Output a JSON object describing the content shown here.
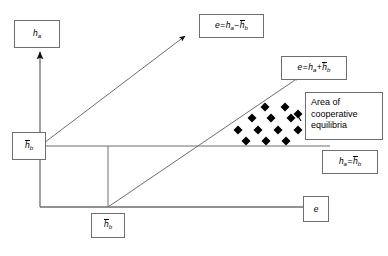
{
  "figure": {
    "background_color": "#ffffff",
    "line_color": "#6e6e6e",
    "axis_color": "#6e6e6e",
    "marker_color": "#000000",
    "box_border_color": "#6e6e6e",
    "width": 388,
    "height": 256
  },
  "axes": {
    "y_axis_label": "ha",
    "x_axis_label": "e",
    "origin": {
      "x": 40,
      "y": 207
    },
    "x_axis_end": {
      "x": 318,
      "y": 207
    },
    "y_axis_end": {
      "x": 40,
      "y": 52
    }
  },
  "labels": {
    "y_axis_box": {
      "text": "ha",
      "var": "h",
      "sub": "a",
      "overbar": false
    },
    "x_axis_box": {
      "text": "e",
      "var": "e",
      "sub": "",
      "overbar": false
    },
    "y_tick_box": {
      "text": "hb",
      "var": "h",
      "sub": "b",
      "overbar": true
    },
    "x_tick_box": {
      "text": "hb",
      "var": "h",
      "sub": "b",
      "overbar": true
    },
    "upper_line_box": {
      "text": "e = ha - hb",
      "lhs": "e",
      "operator": "−",
      "rhs_first": "h",
      "rhs_first_sub": "a",
      "rhs_second": "h",
      "rhs_second_sub": "b",
      "rhs_second_overbar": true
    },
    "lower_line_box": {
      "text": "e = ha + hb",
      "lhs": "e",
      "operator": "+",
      "rhs_first": "h",
      "rhs_first_sub": "a",
      "rhs_second": "h",
      "rhs_second_sub": "b",
      "rhs_second_overbar": true
    },
    "horizontal_line_box": {
      "text": "ha = hb",
      "lhs": "h",
      "lhs_sub": "a",
      "operator": "=",
      "rhs": "h",
      "rhs_sub": "b",
      "rhs_overbar": true
    },
    "area_box": {
      "line1": "Area of",
      "line2": "cooperative",
      "line3": "equilibria"
    }
  },
  "chart_data": {
    "type": "scatter",
    "title": "Area of cooperative equilibria",
    "xlabel": "e",
    "ylabel": "ha",
    "grid": false,
    "legend": "none",
    "lines": [
      {
        "name": "e = ha - hb",
        "from": {
          "x": 40,
          "y": 146
        },
        "to": {
          "x": 188,
          "y": 33
        },
        "arrow": true
      },
      {
        "name": "e = ha + hb",
        "from": {
          "x": 108,
          "y": 207
        },
        "to": {
          "x": 298,
          "y": 78
        },
        "arrow": false
      },
      {
        "name": "ha = hb",
        "from": {
          "x": 40,
          "y": 146
        },
        "to": {
          "x": 330,
          "y": 146
        },
        "arrow": false
      },
      {
        "name": "hb-tick-vertical",
        "from": {
          "x": 108,
          "y": 146
        },
        "to": {
          "x": 108,
          "y": 207
        },
        "arrow": false
      }
    ],
    "markers": {
      "shape": "diamond",
      "color": "#000000",
      "size": 7,
      "count": 13,
      "points": [
        {
          "x": 238,
          "y": 130
        },
        {
          "x": 258,
          "y": 130
        },
        {
          "x": 278,
          "y": 130
        },
        {
          "x": 298,
          "y": 130
        },
        {
          "x": 246,
          "y": 141
        },
        {
          "x": 266,
          "y": 141
        },
        {
          "x": 286,
          "y": 141
        },
        {
          "x": 252,
          "y": 118
        },
        {
          "x": 271,
          "y": 118
        },
        {
          "x": 291,
          "y": 118
        },
        {
          "x": 265,
          "y": 107
        },
        {
          "x": 285,
          "y": 107
        },
        {
          "x": 298,
          "y": 114
        }
      ]
    },
    "connector": {
      "name": "area-box-leader",
      "from": {
        "x": 286,
        "y": 75
      },
      "to": {
        "x": 298,
        "y": 80
      }
    }
  }
}
